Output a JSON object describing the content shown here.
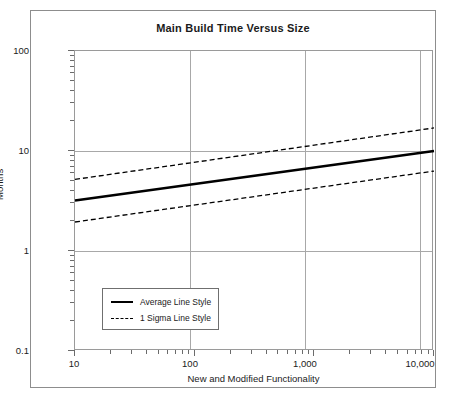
{
  "chart_data": {
    "type": "line",
    "title": "Main Build Time Versus Size",
    "xlabel": "New and Modified Functionality",
    "ylabel": "Months",
    "xscale": "log",
    "yscale": "log",
    "xlim": [
      10,
      10000
    ],
    "ylim": [
      0.1,
      100
    ],
    "grid": true,
    "xticks": [
      10,
      100,
      1000,
      10000
    ],
    "xticklabels": [
      "10",
      "100",
      "1,000",
      "10,000"
    ],
    "yticks": [
      0.1,
      1,
      10,
      100
    ],
    "yticklabels": [
      "0.1",
      "1",
      "10",
      "100"
    ],
    "legend_position": "lower left",
    "series": [
      {
        "name": "Average Line Style",
        "style": "solid",
        "x": [
          10,
          10000
        ],
        "y": [
          3.2,
          10.0
        ]
      },
      {
        "name": "1 Sigma Line Style (upper)",
        "style": "dashed",
        "x": [
          10,
          10000
        ],
        "y": [
          5.2,
          17.0
        ]
      },
      {
        "name": "1 Sigma Line Style (lower)",
        "style": "dashed",
        "x": [
          10,
          10000
        ],
        "y": [
          1.95,
          6.3
        ]
      }
    ]
  },
  "legend": {
    "entries": [
      {
        "label": "Average Line Style",
        "style": "solid"
      },
      {
        "label": "1 Sigma Line Style",
        "style": "dashed"
      }
    ]
  },
  "colors": {
    "line": "#000000",
    "grid": "#a8a8a8",
    "frame": "#9a9a9a",
    "page_border": "#8d8d8d",
    "text": "#1b1b1b"
  }
}
